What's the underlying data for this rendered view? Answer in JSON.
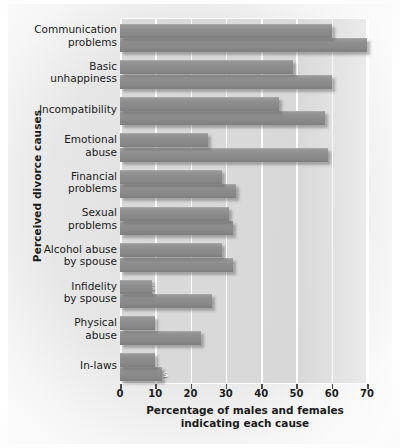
{
  "chart_data": {
    "type": "bar",
    "orientation": "horizontal",
    "title": "",
    "xlabel_line1": "Percentage of males and females",
    "xlabel_line2": "indicating each cause",
    "ylabel": "Perceived divorce causes",
    "xlim": [
      0,
      70
    ],
    "xticks": [
      0,
      10,
      20,
      30,
      40,
      50,
      60,
      70
    ],
    "xtick_labels": [
      "0",
      "10",
      "20",
      "30",
      "40",
      "50",
      "60",
      "70"
    ],
    "grid": true,
    "grid_axis": "x",
    "legend": "inline bar labels",
    "categories": [
      "Communication problems",
      "Basic unhappiness",
      "Incompatibility",
      "Emotional abuse",
      "Financial problems",
      "Sexual problems",
      "Alcohol abuse by spouse",
      "Infidelity by spouse",
      "Physical abuse",
      "In-laws"
    ],
    "category_lines": [
      [
        "Communication",
        "problems"
      ],
      [
        "Basic",
        "unhappiness"
      ],
      [
        "Incompatibility"
      ],
      [
        "Emotional",
        "abuse"
      ],
      [
        "Financial",
        "problems"
      ],
      [
        "Sexual",
        "problems"
      ],
      [
        "Alcohol abuse",
        "by spouse"
      ],
      [
        "Infidelity",
        "by spouse"
      ],
      [
        "Physical",
        "abuse"
      ],
      [
        "In-laws"
      ]
    ],
    "series": [
      {
        "name": "Males",
        "label": "Males",
        "values": [
          60,
          49,
          45,
          25,
          29,
          31,
          29,
          9,
          10,
          10
        ]
      },
      {
        "name": "Females",
        "label": "Females",
        "values": [
          70,
          60,
          58,
          59,
          33,
          32,
          32,
          26,
          23,
          12
        ]
      }
    ],
    "colors": {
      "bar_fill": "#8a8a8a",
      "bar_shadow": "#5a5a5a",
      "plot_background": "#d8d8d8",
      "gridline": "#ffffff",
      "text": "#1b1b1b",
      "bar_label_text": "#ffffff"
    }
  }
}
